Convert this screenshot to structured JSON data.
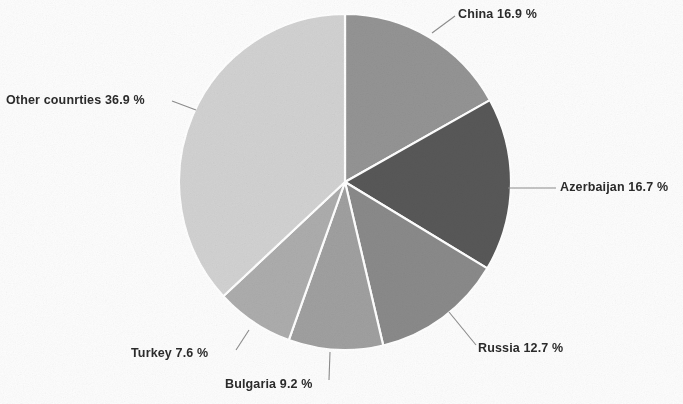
{
  "chart_data": {
    "type": "pie",
    "title": "",
    "subtitle": "",
    "xlabel": "",
    "ylabel": "",
    "legend_position": "none",
    "grid": false,
    "label_format": "{name} {value} %",
    "units": "%",
    "start_angle_deg": 0,
    "direction": "clockwise",
    "categories": [
      "China",
      "Azerbaijan",
      "Russia",
      "Bulgaria",
      "Turkey",
      "Other counrties"
    ],
    "values": [
      16.9,
      16.7,
      12.7,
      9.2,
      7.6,
      36.9
    ],
    "colors": [
      "#949494",
      "#585858",
      "#8a8a8a",
      "#a0a0a0",
      "#adadad",
      "#d2d2d2"
    ],
    "slices": [
      {
        "id": "china",
        "name": "China",
        "value": 16.9,
        "label": "China 16.9 %",
        "color": "#949494",
        "start_deg": 0,
        "end_deg": 60.84
      },
      {
        "id": "azerbaijan",
        "name": "Azerbaijan",
        "value": 16.7,
        "label": "Azerbaijan 16.7 %",
        "color": "#585858",
        "start_deg": 60.84,
        "end_deg": 120.96
      },
      {
        "id": "russia",
        "name": "Russia",
        "value": 12.7,
        "label": "Russia 12.7 %",
        "color": "#8a8a8a",
        "start_deg": 120.96,
        "end_deg": 166.68
      },
      {
        "id": "bulgaria",
        "name": "Bulgaria",
        "value": 9.2,
        "label": "Bulgaria 9.2 %",
        "color": "#a0a0a0",
        "start_deg": 166.68,
        "end_deg": 199.8
      },
      {
        "id": "turkey",
        "name": "Turkey",
        "value": 7.6,
        "label": "Turkey 7.6 %",
        "color": "#adadad",
        "start_deg": 199.8,
        "end_deg": 227.16
      },
      {
        "id": "other",
        "name": "Other counrties",
        "value": 36.9,
        "label": "Other counrties 36.9 %",
        "color": "#d2d2d2",
        "start_deg": 227.16,
        "end_deg": 360
      }
    ],
    "total": 100.0
  },
  "figure": {
    "background_color": "#fdfdfd",
    "separator_color": "#ffffff",
    "leader_line_color": "#8d8d8d",
    "text_color": "#2b2b2b",
    "center": {
      "x": 345,
      "y": 182
    },
    "radius": {
      "x": 166,
      "y": 168
    }
  }
}
